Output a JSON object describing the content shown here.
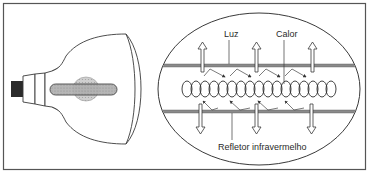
{
  "diagram": {
    "type": "technical-illustration",
    "colors": {
      "stroke": "#3a3a3a",
      "frame": "#555555",
      "background": "#ffffff",
      "bar": "#8a8a8a",
      "tube_fill": "#a8a8a8",
      "glow_fill": "#bdbdbd",
      "base_cap": "#2b2b2b"
    },
    "panels": [
      {
        "id": "lamp-side-view",
        "description": "Side view of the reflector lamp with base and filament tube"
      },
      {
        "id": "filament-detail",
        "description": "Enlarged elliptical detail of the coiled filament between infrared reflector layers"
      }
    ],
    "labels": {
      "light": "Luz",
      "heat": "Calor",
      "reflector": "Refletor infravermelho"
    },
    "arrows": {
      "up_count": 3,
      "down_count": 3,
      "reflected_zigzags_top": 4,
      "reflected_zigzags_bottom": 4
    },
    "coil": {
      "loops": 17
    }
  }
}
